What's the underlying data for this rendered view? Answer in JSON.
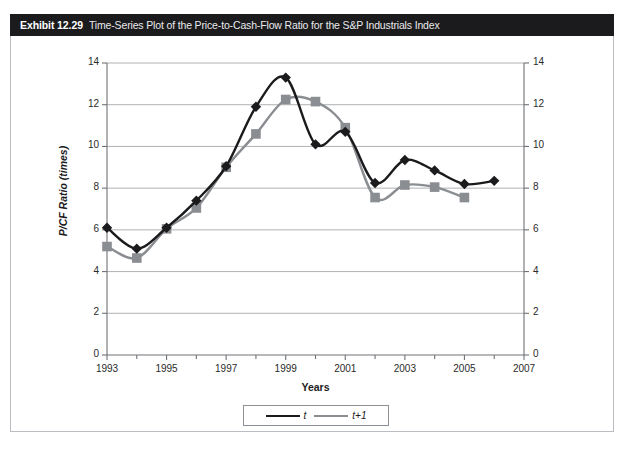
{
  "exhibit": {
    "label": "Exhibit 12.29",
    "title": "Time-Series Plot of the Price-to-Cash-Flow Ratio for the S&P Industrials Index"
  },
  "legend": {
    "items": [
      {
        "name": "t",
        "marker": "diamond",
        "color": "#1b1b1d"
      },
      {
        "name": "t+1",
        "marker": "square",
        "color": "#8a8d91"
      }
    ]
  },
  "axis_titles": {
    "y": "P/CF Ratio (times)",
    "x": "Years"
  },
  "colors": {
    "series_t": "#1b1b1d",
    "series_t1": "#8a8d91",
    "grid": "#9a9da1",
    "axis": "#6f7276",
    "header_bg": "#1b1b1d",
    "frame": "#b9bcc0"
  },
  "chart_data": {
    "type": "line",
    "title": "Time-Series Plot of the Price-to-Cash-Flow Ratio for the S&P Industrials Index",
    "xlabel": "Years",
    "ylabel": "P/CF Ratio (times)",
    "xlim": [
      1993,
      2007
    ],
    "ylim": [
      0,
      14
    ],
    "ytick_step": 2,
    "yticks": [
      0,
      2,
      4,
      6,
      8,
      10,
      12,
      14
    ],
    "xticks_major": [
      1993,
      1995,
      1997,
      1999,
      2001,
      2003,
      2005,
      2007
    ],
    "xticks_minor": [
      1994,
      1996,
      1998,
      2000,
      2002,
      2004,
      2006
    ],
    "grid": "horizontal",
    "dual_y_axis": true,
    "legend_position": "bottom-center",
    "x": [
      1993,
      1994,
      1995,
      1996,
      1997,
      1998,
      1999,
      2000,
      2001,
      2002,
      2003,
      2004,
      2005,
      2006
    ],
    "series": [
      {
        "name": "t",
        "marker": "diamond",
        "color": "#1b1b1d",
        "values": [
          6.1,
          5.1,
          6.1,
          7.4,
          9.05,
          11.9,
          13.3,
          10.1,
          10.7,
          8.25,
          9.35,
          8.85,
          8.2,
          8.35
        ]
      },
      {
        "name": "t+1",
        "marker": "square",
        "color": "#8a8d91",
        "values": [
          5.2,
          4.65,
          6.05,
          7.05,
          9.0,
          10.6,
          12.25,
          12.15,
          10.9,
          7.55,
          8.15,
          8.05,
          7.55,
          null
        ]
      }
    ]
  }
}
